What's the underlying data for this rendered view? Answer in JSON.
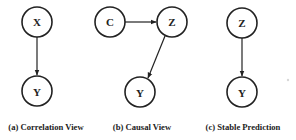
{
  "figure": {
    "panels": [
      {
        "id": "a",
        "caption": "(a) Correlation View",
        "nodes": [
          {
            "label": "X",
            "cx": 37,
            "cy": 22
          },
          {
            "label": "Y",
            "cx": 37,
            "cy": 91
          }
        ],
        "edges": [
          {
            "from": "X",
            "to": "Y"
          }
        ]
      },
      {
        "id": "b",
        "caption": "(b) Causal View",
        "nodes": [
          {
            "label": "C",
            "cx": 110,
            "cy": 22
          },
          {
            "label": "Z",
            "cx": 172,
            "cy": 22
          },
          {
            "label": "Y",
            "cx": 140,
            "cy": 92
          }
        ],
        "edges": [
          {
            "from": "C",
            "to": "Z"
          },
          {
            "from": "Z",
            "to": "Y"
          }
        ]
      },
      {
        "id": "c",
        "caption": "(c) Stable Prediction",
        "nodes": [
          {
            "label": "Z",
            "cx": 242,
            "cy": 23
          },
          {
            "label": "Y",
            "cx": 242,
            "cy": 92
          }
        ],
        "edges": [
          {
            "from": "Z",
            "to": "Y"
          }
        ]
      }
    ],
    "colors": {
      "stroke": "#222222",
      "background": "#ffffff"
    }
  }
}
